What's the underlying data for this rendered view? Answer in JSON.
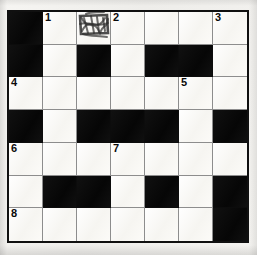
{
  "puzzle": {
    "type": "crossword-grid",
    "rows": 7,
    "columns": 7,
    "colors": {
      "block": "#0c0c0c",
      "open": "#fbfaf7",
      "gridline": "#8d8d8d",
      "border": "#101010",
      "number": "#0a0a0a",
      "paper": "#f3f2ef"
    },
    "cells": [
      [
        {
          "state": "block",
          "number": ""
        },
        {
          "state": "open",
          "number": "1"
        },
        {
          "state": "open",
          "number": "",
          "mark": "scribble"
        },
        {
          "state": "open",
          "number": "2"
        },
        {
          "state": "open",
          "number": ""
        },
        {
          "state": "open",
          "number": ""
        },
        {
          "state": "open",
          "number": "3"
        }
      ],
      [
        {
          "state": "block",
          "number": ""
        },
        {
          "state": "open",
          "number": ""
        },
        {
          "state": "block",
          "number": ""
        },
        {
          "state": "open",
          "number": ""
        },
        {
          "state": "block",
          "number": ""
        },
        {
          "state": "block",
          "number": ""
        },
        {
          "state": "open",
          "number": ""
        }
      ],
      [
        {
          "state": "open",
          "number": "4"
        },
        {
          "state": "open",
          "number": ""
        },
        {
          "state": "open",
          "number": ""
        },
        {
          "state": "open",
          "number": ""
        },
        {
          "state": "open",
          "number": ""
        },
        {
          "state": "open",
          "number": "5"
        },
        {
          "state": "open",
          "number": ""
        }
      ],
      [
        {
          "state": "block",
          "number": ""
        },
        {
          "state": "open",
          "number": ""
        },
        {
          "state": "block",
          "number": ""
        },
        {
          "state": "block",
          "number": ""
        },
        {
          "state": "block",
          "number": ""
        },
        {
          "state": "open",
          "number": ""
        },
        {
          "state": "block",
          "number": ""
        }
      ],
      [
        {
          "state": "open",
          "number": "6"
        },
        {
          "state": "open",
          "number": ""
        },
        {
          "state": "open",
          "number": ""
        },
        {
          "state": "open",
          "number": "7"
        },
        {
          "state": "open",
          "number": ""
        },
        {
          "state": "open",
          "number": ""
        },
        {
          "state": "open",
          "number": ""
        }
      ],
      [
        {
          "state": "open",
          "number": ""
        },
        {
          "state": "block",
          "number": ""
        },
        {
          "state": "block",
          "number": ""
        },
        {
          "state": "open",
          "number": ""
        },
        {
          "state": "block",
          "number": ""
        },
        {
          "state": "open",
          "number": ""
        },
        {
          "state": "block",
          "number": ""
        }
      ],
      [
        {
          "state": "open",
          "number": "8"
        },
        {
          "state": "open",
          "number": ""
        },
        {
          "state": "open",
          "number": ""
        },
        {
          "state": "open",
          "number": ""
        },
        {
          "state": "open",
          "number": ""
        },
        {
          "state": "open",
          "number": ""
        },
        {
          "state": "block",
          "number": ""
        }
      ]
    ]
  }
}
